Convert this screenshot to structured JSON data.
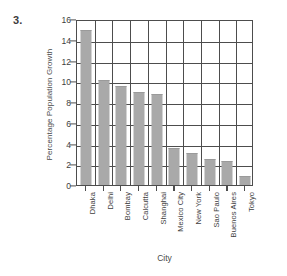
{
  "problem": {
    "number": "3."
  },
  "chart_data": {
    "type": "bar",
    "title": "",
    "xlabel": "City",
    "ylabel": "Percentage Population Growth",
    "categories": [
      "Dhaka",
      "Delhi",
      "Bombay",
      "Calcutta",
      "Shanghai",
      "Mexico City",
      "New York",
      "Sao Paulo",
      "Buenos Aires",
      "Tokyo"
    ],
    "values": [
      14.8,
      10.0,
      9.4,
      8.9,
      8.7,
      3.5,
      3.0,
      2.45,
      2.2,
      0.75
    ],
    "ylim": [
      0,
      16
    ],
    "yticks": [
      0,
      2,
      4,
      6,
      8,
      10,
      12,
      14,
      16
    ],
    "ytick_labels": [
      "0",
      "2",
      "4",
      "6",
      "8",
      "10",
      "12",
      "14",
      "16"
    ],
    "grid": true,
    "legend": "none",
    "bar_color": "#a9a9a9",
    "axis_color": "#4d4d4d",
    "background": "#ffffff"
  }
}
